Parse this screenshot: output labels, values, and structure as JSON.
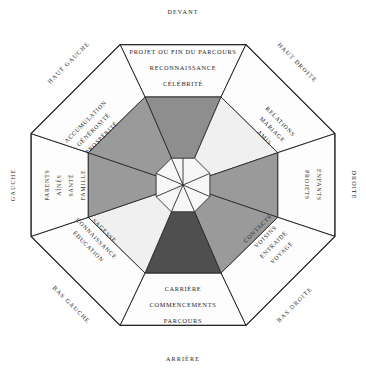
{
  "diagram": {
    "type": "octagon-bagua",
    "center_label": "",
    "palette": {
      "background": "#ffffff",
      "stroke": "#2b2b2b",
      "panel": "#fdfdfd",
      "sector_dark": "#4f4f4f",
      "sector_mid_dark": "#8e8e8e",
      "sector_mid": "#9a9a9a",
      "sector_light": "#f0f0f0",
      "sector_lighter": "#f5f5f5",
      "core": "#f7f7f7"
    },
    "directions": [
      {
        "key": "devant",
        "label": "DEVANT",
        "angle_deg": 270,
        "position": "top"
      },
      {
        "key": "haut_droite",
        "label": "HAUT DROITE",
        "angle_deg": 315,
        "position": "top-right"
      },
      {
        "key": "droite",
        "label": "DROITE",
        "angle_deg": 0,
        "position": "right"
      },
      {
        "key": "bas_droite",
        "label": "BAS DROITE",
        "angle_deg": 45,
        "position": "bottom-right"
      },
      {
        "key": "arriere",
        "label": "ARRIÈRE",
        "angle_deg": 90,
        "position": "bottom"
      },
      {
        "key": "bas_gauche",
        "label": "BAS GAUCHE",
        "angle_deg": 135,
        "position": "bottom-left"
      },
      {
        "key": "gauche",
        "label": "GAUCHE",
        "angle_deg": 180,
        "position": "left"
      },
      {
        "key": "haut_gauche",
        "label": "HAUT GAUCHE",
        "angle_deg": 225,
        "position": "top-left"
      }
    ],
    "sectors": [
      {
        "key": "devant",
        "direction": "DEVANT",
        "position": "top",
        "fill": "#8e8e8e",
        "keywords": [
          "PROJET OU FIN DU PARCOURS",
          "RECONNAISSANCE",
          "CÉLÉBRITÉ"
        ]
      },
      {
        "key": "haut_droite",
        "direction": "HAUT DROITE",
        "position": "top-right",
        "fill": "#f0f0f0",
        "keywords": [
          "RELATIONS",
          "MARIAGE",
          "AMIS"
        ]
      },
      {
        "key": "droite",
        "direction": "DROITE",
        "position": "right",
        "fill": "#9a9a9a",
        "keywords": [
          "ENFANTS",
          "PROJETS"
        ]
      },
      {
        "key": "bas_droite",
        "direction": "BAS DROITE",
        "position": "bottom-right",
        "fill": "#9a9a9a",
        "keywords": [
          "CONTACTS",
          "VOISINS",
          "ENTRAIDE",
          "VOYAGE"
        ]
      },
      {
        "key": "arriere",
        "direction": "ARRIÈRE",
        "position": "bottom",
        "fill": "#4f4f4f",
        "keywords": [
          "CARRIÈRE",
          "COMMENCEMENTS",
          "PARCOURS"
        ]
      },
      {
        "key": "bas_gauche",
        "direction": "BAS GAUCHE",
        "position": "bottom-left",
        "fill": "#f0f0f0",
        "keywords": [
          "SAGESSE",
          "CONNAISSANCE",
          "ÉDUCATION"
        ]
      },
      {
        "key": "gauche",
        "direction": "GAUCHE",
        "position": "left",
        "fill": "#9a9a9a",
        "keywords": [
          "PARENTS",
          "AÎNÉS",
          "SANTÉ",
          "FAMILLE"
        ]
      },
      {
        "key": "haut_gauche",
        "direction": "HAUT GAUCHE",
        "position": "top-left",
        "fill": "#9a9a9a",
        "keywords": [
          "ACCUMULATION",
          "GÉNÉROSITÉ",
          "PROSPÉRITÉ"
        ]
      }
    ],
    "labels": {
      "devant": "DEVANT",
      "haut_droite": "HAUT DROITE",
      "droite": "DROITE",
      "bas_droite": "BAS DROITE",
      "arriere": "ARRIÈRE",
      "bas_gauche": "BAS GAUCHE",
      "gauche": "GAUCHE",
      "haut_gauche": "HAUT GAUCHE",
      "devant_1": "PROJET OU FIN DU PARCOURS",
      "devant_2": "RECONNAISSANCE",
      "devant_3": "CÉLÉBRITÉ",
      "haut_droite_1": "RELATIONS",
      "haut_droite_2": "MARIAGE",
      "haut_droite_3": "AMIS",
      "droite_1": "ENFANTS",
      "droite_2": "PROJETS",
      "bas_droite_1": "CONTACTS",
      "bas_droite_2": "VOISINS",
      "bas_droite_3": "ENTRAIDE",
      "bas_droite_4": "VOYAGE",
      "arriere_1": "CARRIÈRE",
      "arriere_2": "COMMENCEMENTS",
      "arriere_3": "PARCOURS",
      "bas_gauche_1": "SAGESSE",
      "bas_gauche_2": "CONNAISSANCE",
      "bas_gauche_3": "ÉDUCATION",
      "gauche_1": "PARENTS",
      "gauche_2": "AÎNÉS",
      "gauche_3": "SANTÉ",
      "gauche_4": "FAMILLE",
      "haut_gauche_1": "ACCUMULATION",
      "haut_gauche_2": "GÉNÉROSITÉ",
      "haut_gauche_3": "PROSPÉRITÉ"
    }
  }
}
